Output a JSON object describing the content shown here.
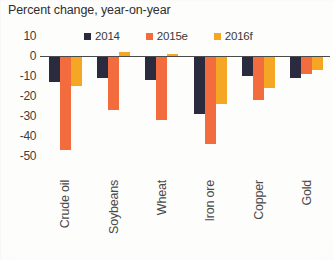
{
  "chart_data": {
    "type": "bar",
    "title": "Percent change, year-on-year",
    "xlabel": "",
    "ylabel": "",
    "ylim": [
      -55,
      10
    ],
    "yticks": [
      10,
      0,
      -10,
      -20,
      -30,
      -40,
      -50
    ],
    "ytick_labels": [
      "10",
      "0",
      "-10",
      "-20",
      "-30",
      "-40",
      "-50"
    ],
    "grid": false,
    "legend_position": "top-center",
    "categories": [
      "Crude oil",
      "Soybeans",
      "Wheat",
      "Iron ore",
      "Copper",
      "Gold"
    ],
    "series": [
      {
        "name": "2014",
        "color": "#2b2b3f",
        "values": [
          -13,
          -11,
          -12,
          -29,
          -10,
          -11
        ]
      },
      {
        "name": "2015e",
        "color": "#f26c3d",
        "values": [
          -47,
          -27,
          -32,
          -44,
          -22,
          -9
        ]
      },
      {
        "name": "2016f",
        "color": "#f5a623",
        "values": [
          -15,
          2,
          1,
          -24,
          -16,
          -7
        ]
      }
    ]
  },
  "legend": {
    "items": [
      {
        "label": "2014",
        "color": "#2b2b3f",
        "icon": "square-swatch-icon"
      },
      {
        "label": "2015e",
        "color": "#f26c3d",
        "icon": "square-swatch-icon"
      },
      {
        "label": "2016f",
        "color": "#f5a623",
        "icon": "square-swatch-icon"
      }
    ]
  },
  "colors": {
    "series_2014": "#2b2b3f",
    "series_2015e": "#f26c3d",
    "series_2016f": "#f5a623",
    "axis": "#4a4a4a",
    "text": "#3d3d3d",
    "background": "#fdfdfb"
  }
}
